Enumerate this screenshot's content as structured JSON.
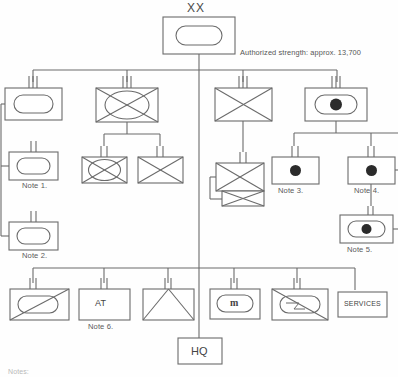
{
  "diagram": {
    "title_echelon": "XX",
    "strength_note": "Authorized strength: approx. 13,700",
    "notes_heading": "Notes:",
    "colors": {
      "line": "#6b6b6b",
      "symbol_fill": "#2b2b2b",
      "text": "#555555",
      "background": "#fefefe"
    }
  },
  "units": {
    "division_hq": {
      "echelon": "XX",
      "symbol": "infantry-oval",
      "label": ""
    },
    "regiments": [
      {
        "id": "inf-regt-1",
        "symbol": "infantry-oval",
        "echelon_ticks": 3,
        "label": ""
      },
      {
        "id": "mech-inf-regt",
        "symbol": "mechanized-infantry",
        "echelon_ticks": 3,
        "label": ""
      },
      {
        "id": "armor-regt",
        "symbol": "armor",
        "echelon_ticks": 3,
        "label": ""
      },
      {
        "id": "artillery-regt",
        "symbol": "artillery-oval",
        "echelon_ticks": 3,
        "label": ""
      }
    ],
    "infantry_subordinates": [
      {
        "id": "inf-regt-2",
        "symbol": "infantry-oval",
        "echelon_ticks": 2,
        "label": "Note 1."
      },
      {
        "id": "inf-regt-3",
        "symbol": "infantry-oval",
        "echelon_ticks": 2,
        "label": "Note 2."
      }
    ],
    "mech_subordinates": [
      {
        "id": "mech-inf-bn",
        "symbol": "mechanized-infantry",
        "echelon_ticks": 2,
        "label": ""
      },
      {
        "id": "armor-bn-a",
        "symbol": "armor",
        "echelon_ticks": 2,
        "label": ""
      }
    ],
    "armor_subordinates": [
      {
        "id": "armor-bn-b",
        "symbol": "armor-stacked",
        "echelon_ticks": 2,
        "label": ""
      }
    ],
    "artillery_subordinates": [
      {
        "id": "arty-bn-1",
        "symbol": "artillery",
        "echelon_ticks": 2,
        "label": "Note 3."
      },
      {
        "id": "arty-bn-2",
        "symbol": "artillery",
        "echelon_ticks": 2,
        "label": "Note 4."
      },
      {
        "id": "arty-bn-3",
        "symbol": "artillery-oval",
        "echelon_ticks": 2,
        "label": "Note 5."
      }
    ],
    "divisional_troops": [
      {
        "id": "recon-bn",
        "symbol": "reconnaissance",
        "echelon_ticks": 2,
        "label": ""
      },
      {
        "id": "antitank-bn",
        "symbol": "text-box",
        "text": "AT",
        "echelon_ticks": 2,
        "label": "Note 6."
      },
      {
        "id": "engineer-bn",
        "symbol": "engineer",
        "echelon_ticks": 2,
        "label": ""
      },
      {
        "id": "military-police-bn",
        "symbol": "military-police",
        "text": "m",
        "echelon_ticks": 2,
        "label": ""
      },
      {
        "id": "signal-bn",
        "symbol": "signal",
        "echelon_ticks": 2,
        "label": ""
      },
      {
        "id": "services-bn",
        "symbol": "text-box",
        "text": "SERVICES",
        "echelon_ticks": 0,
        "label": ""
      }
    ],
    "headquarters": {
      "id": "hq",
      "symbol": "text-box",
      "text": "HQ",
      "echelon_ticks": 0
    }
  }
}
